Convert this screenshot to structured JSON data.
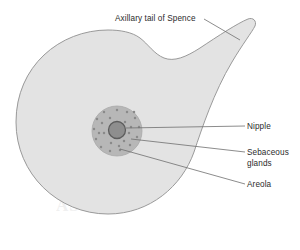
{
  "figure": {
    "type": "anatomical-diagram",
    "background_color": "#ffffff",
    "watermark_text": "ASTUDY"
  },
  "colors": {
    "breast_fill": "#e3e3e3",
    "breast_outline": "#9a9a9a",
    "areola_fill": "#b7b7b7",
    "areola_outline": "#a0a0a0",
    "nipple_fill": "#8e8e8e",
    "nipple_outline": "#5d5d5d",
    "gland_dot": "#8a8a8a",
    "leader_line": "#6f6f6f",
    "text": "#2b2b2b"
  },
  "labels": {
    "axillary_tail": "Axillary tail of Spence",
    "nipple": "Nipple",
    "sebaceous_glands": "Sebaceous\nglands",
    "areola": "Areola"
  },
  "structures": [
    {
      "name": "breast-body",
      "shape": "circle-with-axillary-tail",
      "center": [
        108,
        122
      ],
      "radius": 92
    },
    {
      "name": "axillary-tail-of-spence",
      "shape": "tapering-lobe",
      "direction": "upper-right",
      "tip": [
        252,
        24
      ]
    },
    {
      "name": "areola",
      "shape": "circle",
      "center": [
        117,
        131
      ],
      "radius": 25
    },
    {
      "name": "nipple",
      "shape": "circle",
      "center": [
        117,
        130
      ],
      "radius": 8
    }
  ],
  "gland_dots": [
    [
      117,
      110
    ],
    [
      127,
      112
    ],
    [
      135,
      118
    ],
    [
      139,
      127
    ],
    [
      137,
      137
    ],
    [
      130,
      145
    ],
    [
      120,
      150
    ],
    [
      110,
      151
    ],
    [
      101,
      147
    ],
    [
      96,
      139
    ],
    [
      94,
      129
    ],
    [
      97,
      119
    ],
    [
      104,
      112
    ],
    [
      111,
      143
    ],
    [
      124,
      141
    ],
    [
      129,
      133
    ],
    [
      104,
      133
    ],
    [
      102,
      123
    ],
    [
      110,
      118
    ],
    [
      125,
      122
    ],
    [
      131,
      127
    ],
    [
      99,
      133
    ],
    [
      119,
      146
    ],
    [
      134,
      112
    ]
  ],
  "leader_lines": [
    {
      "target": "axillary_tail",
      "from": [
        204,
        19
      ],
      "to": [
        240,
        40
      ]
    },
    {
      "target": "nipple",
      "from": [
        245,
        126
      ],
      "to": [
        126,
        128
      ]
    },
    {
      "target": "sebaceous_glands",
      "from": [
        245,
        152
      ],
      "to": [
        131,
        139
      ]
    },
    {
      "target": "areola",
      "from": [
        245,
        184
      ],
      "to": [
        120,
        149
      ]
    }
  ]
}
